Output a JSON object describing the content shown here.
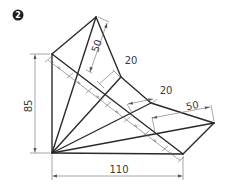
{
  "figure": {
    "number": "2",
    "type": "technical-drawing",
    "dimensions": {
      "height_left": "85",
      "width_bottom": "110",
      "top_edge": "50",
      "upper_offset": "20",
      "middle_offset": "20",
      "right_edge": "50"
    },
    "equal_marks": [
      "=",
      "=",
      "=",
      "=",
      "=",
      "=",
      "="
    ],
    "colors": {
      "object_lines": "#2a2a2a",
      "dimension_lines": "#6a6a6a",
      "badge": "#1e1e1e"
    }
  }
}
